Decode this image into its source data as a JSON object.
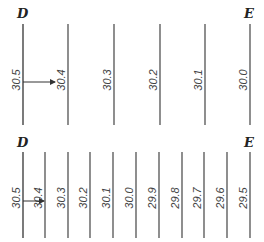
{
  "top_panel": {
    "start_label": "D",
    "end_label": "E",
    "lines": [
      {
        "x": 23,
        "value": "30.5"
      },
      {
        "x": 68,
        "value": "30.4"
      },
      {
        "x": 114,
        "value": "30.3"
      },
      {
        "x": 160,
        "value": "30.2"
      },
      {
        "x": 205,
        "value": "30.1"
      },
      {
        "x": 250,
        "value": "30.0"
      }
    ]
  },
  "bottom_panel": {
    "start_label": "D",
    "end_label": "E",
    "lines": [
      {
        "x": 23,
        "value": "30.5"
      },
      {
        "x": 45,
        "value": "30.4"
      },
      {
        "x": 68,
        "value": "30.3"
      },
      {
        "x": 90,
        "value": "30.2"
      },
      {
        "x": 113,
        "value": "30.1"
      },
      {
        "x": 136,
        "value": "30.0"
      },
      {
        "x": 159,
        "value": "29.9"
      },
      {
        "x": 182,
        "value": "29.8"
      },
      {
        "x": 204,
        "value": "29.7"
      },
      {
        "x": 227,
        "value": "29.6"
      },
      {
        "x": 250,
        "value": "29.5"
      }
    ]
  }
}
